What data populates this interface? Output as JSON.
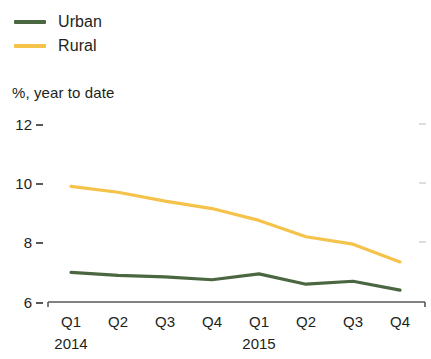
{
  "legend": {
    "items": [
      {
        "label": "Urban",
        "color": "#4a6741",
        "name": "urban"
      },
      {
        "label": "Rural",
        "color": "#f5c24a",
        "name": "rural"
      }
    ]
  },
  "axis_caption": "%, year to date",
  "chart_data": {
    "type": "line",
    "title": "",
    "subtitle": "",
    "xlabel": "",
    "ylabel": "%, year to date",
    "ylim": [
      6,
      12
    ],
    "yticks": [
      6,
      8,
      10,
      12
    ],
    "ytick_labels": [
      "6",
      "8",
      "10",
      "12"
    ],
    "grid": false,
    "legend_position": "top-left",
    "categories": [
      "Q1",
      "Q2",
      "Q3",
      "Q4",
      "Q1",
      "Q2",
      "Q3",
      "Q4"
    ],
    "x_groups": [
      {
        "label": "2014",
        "span": 4
      },
      {
        "label": "2015",
        "span": 4
      }
    ],
    "series": [
      {
        "name": "Urban",
        "color": "#4a6741",
        "values": [
          7.0,
          6.9,
          6.85,
          6.75,
          6.95,
          6.6,
          6.7,
          6.4
        ]
      },
      {
        "name": "Rural",
        "color": "#f5c24a",
        "values": [
          9.9,
          9.7,
          9.4,
          9.15,
          8.75,
          8.2,
          7.95,
          7.35
        ]
      }
    ]
  }
}
